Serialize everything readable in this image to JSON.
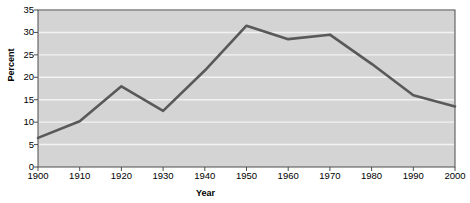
{
  "chart_data": {
    "type": "line",
    "title": "",
    "xlabel": "Year",
    "ylabel": "Percent",
    "x": [
      1900,
      1910,
      1920,
      1930,
      1940,
      1950,
      1960,
      1970,
      1980,
      1990,
      2000
    ],
    "categories": [
      "1900",
      "1910",
      "1920",
      "1930",
      "1940",
      "1950",
      "1960",
      "1970",
      "1980",
      "1990",
      "2000"
    ],
    "values": [
      6.5,
      10.2,
      18.0,
      12.5,
      21.5,
      31.5,
      28.5,
      29.5,
      23.0,
      16.0,
      13.5
    ],
    "series": [
      {
        "name": "Percent",
        "values": [
          6.5,
          10.2,
          18.0,
          12.5,
          21.5,
          31.5,
          28.5,
          29.5,
          23.0,
          16.0,
          13.5
        ],
        "color": "#595959"
      }
    ],
    "xlim": [
      1900,
      2000
    ],
    "ylim": [
      0,
      35
    ],
    "xticks": [
      "1900",
      "1910",
      "1920",
      "1930",
      "1940",
      "1950",
      "1960",
      "1970",
      "1980",
      "1990",
      "2000"
    ],
    "yticks": [
      "0",
      "5",
      "10",
      "15",
      "20",
      "25",
      "30",
      "35"
    ],
    "ytick_values": [
      0,
      5,
      10,
      15,
      20,
      25,
      30,
      35
    ],
    "grid": "horizontal",
    "legend": "none",
    "plot_background_color": "#d4d4d4",
    "gridline_color": "#f2f2f2",
    "axis_color": "#4d4d4d",
    "line_color": "#595959",
    "page_background_color": "#ffffff"
  }
}
